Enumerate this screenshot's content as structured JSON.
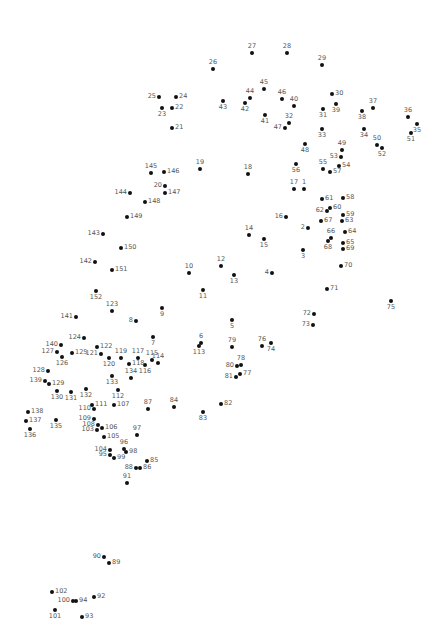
{
  "puzzle": {
    "type": "connect-the-dots",
    "dot_color": "#111111",
    "label_color": "#555555",
    "points": [
      {
        "n": "1",
        "x": 304,
        "y": 189,
        "pos": "t"
      },
      {
        "n": "2",
        "x": 308,
        "y": 228,
        "pos": "l"
      },
      {
        "n": "3",
        "x": 303,
        "y": 250,
        "pos": "b"
      },
      {
        "n": "4",
        "x": 272,
        "y": 273,
        "pos": "l"
      },
      {
        "n": "5",
        "x": 232,
        "y": 320,
        "pos": "b"
      },
      {
        "n": "6",
        "x": 201,
        "y": 343,
        "pos": "t"
      },
      {
        "n": "7",
        "x": 153,
        "y": 337,
        "pos": "b"
      },
      {
        "n": "8",
        "x": 136,
        "y": 321,
        "pos": "l"
      },
      {
        "n": "9",
        "x": 162,
        "y": 308,
        "pos": "b"
      },
      {
        "n": "10",
        "x": 189,
        "y": 273,
        "pos": "t"
      },
      {
        "n": "11",
        "x": 203,
        "y": 290,
        "pos": "b"
      },
      {
        "n": "12",
        "x": 221,
        "y": 266,
        "pos": "t"
      },
      {
        "n": "13",
        "x": 234,
        "y": 275,
        "pos": "b"
      },
      {
        "n": "14",
        "x": 249,
        "y": 235,
        "pos": "t"
      },
      {
        "n": "15",
        "x": 264,
        "y": 239,
        "pos": "b"
      },
      {
        "n": "16",
        "x": 286,
        "y": 217,
        "pos": "l"
      },
      {
        "n": "17",
        "x": 294,
        "y": 189,
        "pos": "t"
      },
      {
        "n": "18",
        "x": 248,
        "y": 174,
        "pos": "t"
      },
      {
        "n": "19",
        "x": 200,
        "y": 169,
        "pos": "t"
      },
      {
        "n": "20",
        "x": 165,
        "y": 186,
        "pos": "l"
      },
      {
        "n": "21",
        "x": 172,
        "y": 128,
        "pos": "r"
      },
      {
        "n": "22",
        "x": 172,
        "y": 108,
        "pos": "r"
      },
      {
        "n": "23",
        "x": 162,
        "y": 108,
        "pos": "b"
      },
      {
        "n": "24",
        "x": 176,
        "y": 97,
        "pos": "r"
      },
      {
        "n": "25",
        "x": 159,
        "y": 97,
        "pos": "l"
      },
      {
        "n": "26",
        "x": 213,
        "y": 69,
        "pos": "t"
      },
      {
        "n": "27",
        "x": 252,
        "y": 53,
        "pos": "t"
      },
      {
        "n": "28",
        "x": 287,
        "y": 53,
        "pos": "t"
      },
      {
        "n": "29",
        "x": 322,
        "y": 65,
        "pos": "t"
      },
      {
        "n": "30",
        "x": 332,
        "y": 94,
        "pos": "r"
      },
      {
        "n": "31",
        "x": 323,
        "y": 109,
        "pos": "b"
      },
      {
        "n": "32",
        "x": 289,
        "y": 123,
        "pos": "t"
      },
      {
        "n": "33",
        "x": 322,
        "y": 129,
        "pos": "b"
      },
      {
        "n": "34",
        "x": 364,
        "y": 129,
        "pos": "b"
      },
      {
        "n": "35",
        "x": 417,
        "y": 124,
        "pos": "b"
      },
      {
        "n": "36",
        "x": 408,
        "y": 117,
        "pos": "t"
      },
      {
        "n": "37",
        "x": 373,
        "y": 108,
        "pos": "t"
      },
      {
        "n": "38",
        "x": 362,
        "y": 111,
        "pos": "b"
      },
      {
        "n": "39",
        "x": 336,
        "y": 104,
        "pos": "b"
      },
      {
        "n": "40",
        "x": 294,
        "y": 106,
        "pos": "t"
      },
      {
        "n": "41",
        "x": 265,
        "y": 115,
        "pos": "b"
      },
      {
        "n": "42",
        "x": 245,
        "y": 103,
        "pos": "b"
      },
      {
        "n": "43",
        "x": 223,
        "y": 101,
        "pos": "b"
      },
      {
        "n": "44",
        "x": 250,
        "y": 98,
        "pos": "t"
      },
      {
        "n": "45",
        "x": 264,
        "y": 89,
        "pos": "t"
      },
      {
        "n": "46",
        "x": 282,
        "y": 99,
        "pos": "t"
      },
      {
        "n": "47",
        "x": 285,
        "y": 128,
        "pos": "l"
      },
      {
        "n": "48",
        "x": 305,
        "y": 144,
        "pos": "b"
      },
      {
        "n": "49",
        "x": 342,
        "y": 150,
        "pos": "t"
      },
      {
        "n": "50",
        "x": 377,
        "y": 145,
        "pos": "t"
      },
      {
        "n": "51",
        "x": 411,
        "y": 133,
        "pos": "b"
      },
      {
        "n": "52",
        "x": 382,
        "y": 148,
        "pos": "b"
      },
      {
        "n": "53",
        "x": 341,
        "y": 157,
        "pos": "l"
      },
      {
        "n": "54",
        "x": 339,
        "y": 166,
        "pos": "r"
      },
      {
        "n": "55",
        "x": 323,
        "y": 169,
        "pos": "t"
      },
      {
        "n": "56",
        "x": 296,
        "y": 164,
        "pos": "b"
      },
      {
        "n": "57",
        "x": 330,
        "y": 172,
        "pos": "r"
      },
      {
        "n": "58",
        "x": 343,
        "y": 198,
        "pos": "r"
      },
      {
        "n": "59",
        "x": 343,
        "y": 215,
        "pos": "r"
      },
      {
        "n": "60",
        "x": 330,
        "y": 208,
        "pos": "r"
      },
      {
        "n": "61",
        "x": 322,
        "y": 199,
        "pos": "r"
      },
      {
        "n": "62",
        "x": 327,
        "y": 211,
        "pos": "l"
      },
      {
        "n": "63",
        "x": 342,
        "y": 221,
        "pos": "r"
      },
      {
        "n": "64",
        "x": 345,
        "y": 232,
        "pos": "r"
      },
      {
        "n": "65",
        "x": 343,
        "y": 243,
        "pos": "r"
      },
      {
        "n": "66",
        "x": 331,
        "y": 238,
        "pos": "t"
      },
      {
        "n": "67",
        "x": 321,
        "y": 221,
        "pos": "r"
      },
      {
        "n": "68",
        "x": 328,
        "y": 241,
        "pos": "b"
      },
      {
        "n": "69",
        "x": 343,
        "y": 249,
        "pos": "r"
      },
      {
        "n": "70",
        "x": 341,
        "y": 266,
        "pos": "r"
      },
      {
        "n": "71",
        "x": 327,
        "y": 289,
        "pos": "r"
      },
      {
        "n": "72",
        "x": 314,
        "y": 314,
        "pos": "l"
      },
      {
        "n": "73",
        "x": 313,
        "y": 325,
        "pos": "l"
      },
      {
        "n": "74",
        "x": 271,
        "y": 343,
        "pos": "b"
      },
      {
        "n": "75",
        "x": 391,
        "y": 301,
        "pos": "b"
      },
      {
        "n": "76",
        "x": 262,
        "y": 346,
        "pos": "t"
      },
      {
        "n": "77",
        "x": 240,
        "y": 374,
        "pos": "r"
      },
      {
        "n": "78",
        "x": 241,
        "y": 365,
        "pos": "t"
      },
      {
        "n": "79",
        "x": 232,
        "y": 347,
        "pos": "t"
      },
      {
        "n": "80",
        "x": 237,
        "y": 366,
        "pos": "l"
      },
      {
        "n": "81",
        "x": 236,
        "y": 377,
        "pos": "l"
      },
      {
        "n": "82",
        "x": 221,
        "y": 404,
        "pos": "r"
      },
      {
        "n": "83",
        "x": 203,
        "y": 412,
        "pos": "b"
      },
      {
        "n": "84",
        "x": 174,
        "y": 407,
        "pos": "t"
      },
      {
        "n": "85",
        "x": 147,
        "y": 461,
        "pos": "r"
      },
      {
        "n": "86",
        "x": 140,
        "y": 468,
        "pos": "r"
      },
      {
        "n": "87",
        "x": 148,
        "y": 409,
        "pos": "t"
      },
      {
        "n": "88",
        "x": 136,
        "y": 468,
        "pos": "l"
      },
      {
        "n": "89",
        "x": 109,
        "y": 563,
        "pos": "r"
      },
      {
        "n": "90",
        "x": 104,
        "y": 557,
        "pos": "l"
      },
      {
        "n": "91",
        "x": 127,
        "y": 483,
        "pos": "t"
      },
      {
        "n": "92",
        "x": 94,
        "y": 597,
        "pos": "r"
      },
      {
        "n": "93",
        "x": 82,
        "y": 617,
        "pos": "r"
      },
      {
        "n": "94",
        "x": 76,
        "y": 601,
        "pos": "r"
      },
      {
        "n": "95",
        "x": 110,
        "y": 455,
        "pos": "l"
      },
      {
        "n": "96",
        "x": 124,
        "y": 449,
        "pos": "t"
      },
      {
        "n": "97",
        "x": 137,
        "y": 435,
        "pos": "t"
      },
      {
        "n": "98",
        "x": 126,
        "y": 452,
        "pos": "r"
      },
      {
        "n": "99",
        "x": 114,
        "y": 458,
        "pos": "r"
      },
      {
        "n": "100",
        "x": 73,
        "y": 601,
        "pos": "l"
      },
      {
        "n": "101",
        "x": 55,
        "y": 610,
        "pos": "b"
      },
      {
        "n": "102",
        "x": 52,
        "y": 592,
        "pos": "r"
      },
      {
        "n": "103",
        "x": 97,
        "y": 430,
        "pos": "l"
      },
      {
        "n": "104",
        "x": 110,
        "y": 450,
        "pos": "l"
      },
      {
        "n": "105",
        "x": 104,
        "y": 437,
        "pos": "r"
      },
      {
        "n": "106",
        "x": 102,
        "y": 428,
        "pos": "r"
      },
      {
        "n": "107",
        "x": 114,
        "y": 405,
        "pos": "r"
      },
      {
        "n": "108",
        "x": 98,
        "y": 425,
        "pos": "l"
      },
      {
        "n": "109",
        "x": 94,
        "y": 419,
        "pos": "l"
      },
      {
        "n": "110",
        "x": 94,
        "y": 409,
        "pos": "l"
      },
      {
        "n": "111",
        "x": 92,
        "y": 405,
        "pos": "r"
      },
      {
        "n": "112",
        "x": 118,
        "y": 390,
        "pos": "b"
      },
      {
        "n": "113",
        "x": 199,
        "y": 346,
        "pos": "b"
      },
      {
        "n": "114",
        "x": 158,
        "y": 363,
        "pos": "t"
      },
      {
        "n": "115",
        "x": 152,
        "y": 360,
        "pos": "t"
      },
      {
        "n": "116",
        "x": 145,
        "y": 365,
        "pos": "b"
      },
      {
        "n": "117",
        "x": 138,
        "y": 358,
        "pos": "t"
      },
      {
        "n": "118",
        "x": 129,
        "y": 364,
        "pos": "r"
      },
      {
        "n": "119",
        "x": 121,
        "y": 358,
        "pos": "t"
      },
      {
        "n": "120",
        "x": 109,
        "y": 358,
        "pos": "b"
      },
      {
        "n": "121",
        "x": 101,
        "y": 354,
        "pos": "l"
      },
      {
        "n": "122",
        "x": 97,
        "y": 347,
        "pos": "r"
      },
      {
        "n": "123",
        "x": 112,
        "y": 311,
        "pos": "t"
      },
      {
        "n": "124",
        "x": 84,
        "y": 338,
        "pos": "l"
      },
      {
        "n": "125",
        "x": 72,
        "y": 353,
        "pos": "r"
      },
      {
        "n": "126",
        "x": 62,
        "y": 357,
        "pos": "b"
      },
      {
        "n": "127",
        "x": 57,
        "y": 352,
        "pos": "l"
      },
      {
        "n": "128",
        "x": 48,
        "y": 371,
        "pos": "l"
      },
      {
        "n": "129",
        "x": 49,
        "y": 384,
        "pos": "r"
      },
      {
        "n": "130",
        "x": 57,
        "y": 391,
        "pos": "b"
      },
      {
        "n": "131",
        "x": 71,
        "y": 392,
        "pos": "b"
      },
      {
        "n": "132",
        "x": 86,
        "y": 389,
        "pos": "b"
      },
      {
        "n": "133",
        "x": 112,
        "y": 376,
        "pos": "b"
      },
      {
        "n": "134",
        "x": 131,
        "y": 378,
        "pos": "t"
      },
      {
        "n": "135",
        "x": 56,
        "y": 420,
        "pos": "b"
      },
      {
        "n": "136",
        "x": 30,
        "y": 429,
        "pos": "b"
      },
      {
        "n": "137",
        "x": 26,
        "y": 421,
        "pos": "r"
      },
      {
        "n": "138",
        "x": 28,
        "y": 412,
        "pos": "r"
      },
      {
        "n": "139",
        "x": 45,
        "y": 381,
        "pos": "l"
      },
      {
        "n": "140",
        "x": 61,
        "y": 345,
        "pos": "l"
      },
      {
        "n": "141",
        "x": 76,
        "y": 317,
        "pos": "l"
      },
      {
        "n": "142",
        "x": 95,
        "y": 262,
        "pos": "l"
      },
      {
        "n": "143",
        "x": 103,
        "y": 234,
        "pos": "l"
      },
      {
        "n": "144",
        "x": 130,
        "y": 193,
        "pos": "l"
      },
      {
        "n": "145",
        "x": 151,
        "y": 173,
        "pos": "t"
      },
      {
        "n": "146",
        "x": 164,
        "y": 172,
        "pos": "r"
      },
      {
        "n": "147",
        "x": 165,
        "y": 193,
        "pos": "r"
      },
      {
        "n": "148",
        "x": 145,
        "y": 202,
        "pos": "r"
      },
      {
        "n": "149",
        "x": 127,
        "y": 217,
        "pos": "r"
      },
      {
        "n": "150",
        "x": 121,
        "y": 248,
        "pos": "r"
      },
      {
        "n": "151",
        "x": 112,
        "y": 270,
        "pos": "r"
      },
      {
        "n": "152",
        "x": 96,
        "y": 291,
        "pos": "b"
      }
    ]
  }
}
